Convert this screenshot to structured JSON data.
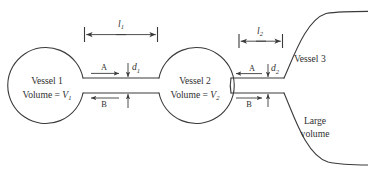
{
  "figure": {
    "stroke_color": "#3a3a3a",
    "text_color": "#2f2f2f",
    "background": "#ffffff"
  },
  "vessels": [
    {
      "id": "vessel-1",
      "name_label": "Vessel 1",
      "volume_prefix": "Volume = ",
      "volume_symbol": "V",
      "volume_subscript": "1"
    },
    {
      "id": "vessel-2",
      "name_label": "Vessel 2",
      "volume_prefix": "Volume = ",
      "volume_symbol": "V",
      "volume_subscript": "2"
    },
    {
      "id": "vessel-3",
      "name_label": "Vessel 3",
      "volume_line_1": "Large",
      "volume_line_2": "volume"
    }
  ],
  "connectors": [
    {
      "id": "connector-1",
      "length_symbol": "l",
      "length_subscript": "1",
      "diameter_symbol": "d",
      "diameter_subscript": "1",
      "flow_top_label": "A",
      "flow_top_direction": "right",
      "flow_bottom_label": "B",
      "flow_bottom_direction": "left"
    },
    {
      "id": "connector-2",
      "length_symbol": "l",
      "length_subscript": "2",
      "diameter_symbol": "d",
      "diameter_subscript": "2",
      "flow_top_label": "A",
      "flow_top_direction": "left",
      "flow_bottom_label": "B",
      "flow_bottom_direction": "right"
    }
  ]
}
